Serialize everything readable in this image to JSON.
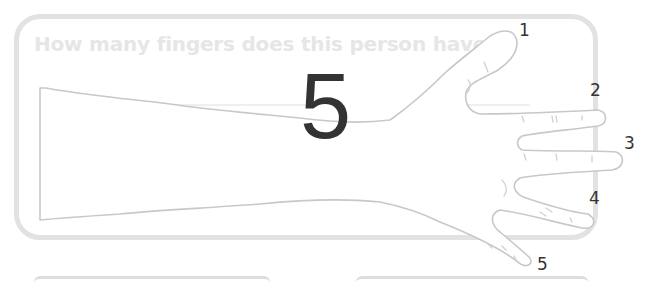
{
  "worksheet": {
    "question": "How many fingers does this person have?",
    "answer": "5",
    "finger_labels": [
      "1",
      "2",
      "3",
      "4",
      "5"
    ],
    "colors": {
      "frame_border": "#e2e2e2",
      "question_text": "#e6e6e6",
      "outline": "#cccccc",
      "answer_text": "#333333",
      "label_text": "#333333"
    },
    "illustration": {
      "subject": "outline of an arm and open hand with five fingers",
      "icon": "hand-outline-icon"
    }
  }
}
